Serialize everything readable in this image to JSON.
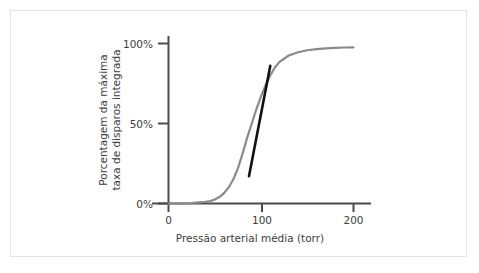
{
  "figure": {
    "background_color": "#ffffff",
    "frame_color": "#e3e3e3",
    "curve_color": "#8a8a8a",
    "tangent_color": "#111111",
    "axis_color": "#4a4a4a",
    "text_color": "#3d3d3d"
  },
  "chart_data": {
    "type": "line",
    "title": "",
    "subtitle": "",
    "xlabel": "Pressão arterial média (torr)",
    "ylabel_line1": "Porcentagem da máxima",
    "ylabel_line2": "taxa de disparos integrada",
    "xlim": [
      0,
      235
    ],
    "ylim": [
      0,
      110
    ],
    "xticks": [
      0,
      100,
      200
    ],
    "xticklabels": [
      "0",
      "100",
      "200"
    ],
    "yticks": [
      0,
      50,
      100
    ],
    "yticklabels": [
      "0%",
      "50%",
      "100%"
    ],
    "grid": false,
    "legend": null,
    "series": [
      {
        "name": "Curva barorreceptora (sigmoide)",
        "color": "#8a8a8a",
        "x": [
          0,
          10,
          20,
          30,
          40,
          45,
          50,
          55,
          60,
          65,
          70,
          75,
          80,
          85,
          90,
          95,
          100,
          105,
          110,
          115,
          120,
          130,
          140,
          150,
          160,
          170,
          180,
          190,
          200
        ],
        "y": [
          0,
          0,
          0,
          0.5,
          1,
          1.5,
          2.5,
          4,
          6.5,
          10,
          15,
          22,
          31,
          41,
          50,
          59,
          67,
          74,
          80,
          85,
          88.5,
          92.5,
          94.5,
          95.8,
          96.5,
          97,
          97.3,
          97.5,
          97.6
        ]
      },
      {
        "name": "Reta tangente (ganho máximo)",
        "color": "#111111",
        "x": [
          87,
          110
        ],
        "y": [
          17,
          86
        ]
      }
    ],
    "annotations": []
  }
}
